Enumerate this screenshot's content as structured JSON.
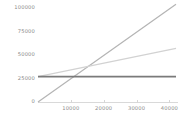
{
  "chart_data": {
    "type": "line",
    "title": "",
    "subtitle": "",
    "xlabel": "",
    "ylabel": "",
    "xlim": [
      0,
      42000
    ],
    "ylim": [
      0,
      100000
    ],
    "grid": false,
    "legend": "none",
    "x_ticks": [
      {
        "value": 10000,
        "label": "10000"
      },
      {
        "value": 20000,
        "label": "20000"
      },
      {
        "value": 30000,
        "label": "30000"
      },
      {
        "value": 40000,
        "label": "40000"
      }
    ],
    "y_ticks": [
      {
        "value": 0,
        "label": "0"
      },
      {
        "value": 25000,
        "label": "25000"
      },
      {
        "value": 50000,
        "label": "50000"
      },
      {
        "value": 75000,
        "label": "75000"
      },
      {
        "value": 100000,
        "label": "100000"
      }
    ],
    "series": [
      {
        "name": "steep-rising-line",
        "color": "#b4b4b4",
        "width": 1.2,
        "x": [
          0,
          42000
        ],
        "values": [
          0,
          104000
        ]
      },
      {
        "name": "shallow-rising-line",
        "color": "#d2d2d2",
        "width": 1.2,
        "x": [
          0,
          42000
        ],
        "values": [
          27000,
          57000
        ]
      },
      {
        "name": "flat-constant-line",
        "color": "#7a7a7a",
        "width": 1.6,
        "x": [
          0,
          42000
        ],
        "values": [
          27000,
          27000
        ]
      }
    ],
    "colors": {
      "axis": "#d9d9d9",
      "tick_text": "#8a8a8a",
      "background": "#ffffff"
    }
  }
}
